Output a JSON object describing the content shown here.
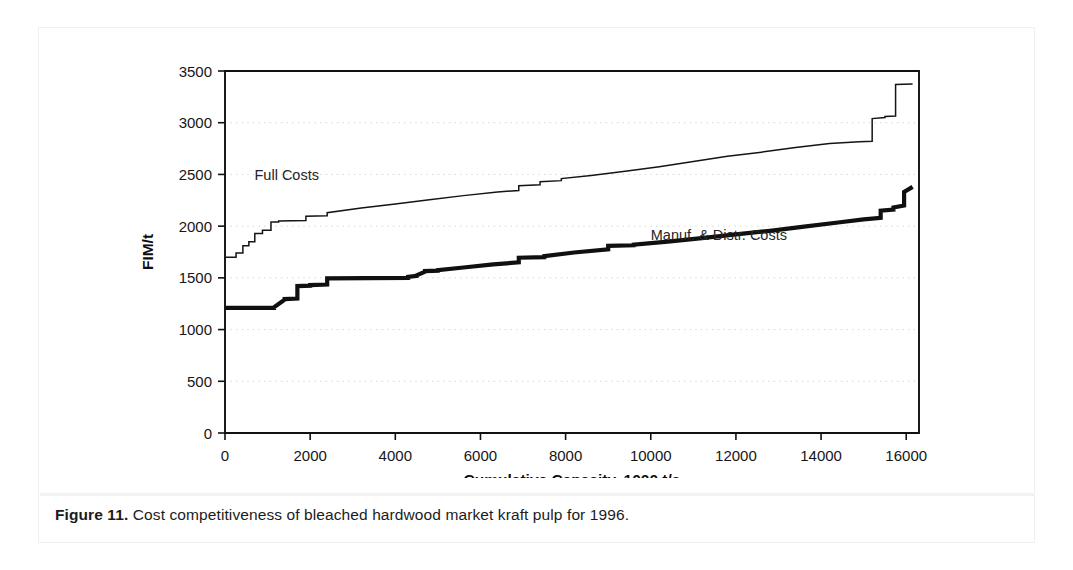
{
  "figure": {
    "caption_label": "Figure 11.",
    "caption_text": " Cost competitiveness of bleached hardwood market kraft pulp for 1996."
  },
  "chart_data": {
    "type": "line",
    "title": "",
    "xlabel": "Cumulative Capacity, 1000 t/a",
    "ylabel": "FIM/t",
    "xlim": [
      0,
      16300
    ],
    "ylim": [
      0,
      3500
    ],
    "xticks": [
      0,
      2000,
      4000,
      6000,
      8000,
      10000,
      12000,
      14000,
      16000
    ],
    "xtick_labels": [
      "0",
      "2000",
      "4000",
      "6000",
      "8000",
      "10000",
      "12000",
      "14000",
      "16000"
    ],
    "yticks": [
      0,
      500,
      1000,
      1500,
      2000,
      2500,
      3000,
      3500
    ],
    "ytick_labels": [
      "0",
      "500",
      "1000",
      "1500",
      "2000",
      "2500",
      "3000",
      "3500"
    ],
    "grid": "horizontal-dotted",
    "legend": "inline-annotations",
    "annotations": [
      {
        "name": "full-costs-label",
        "text": "Full Costs",
        "x": 1450,
        "y": 2450
      },
      {
        "name": "manuf-distr-label",
        "text": "Manuf. & Distr. Costs",
        "x": 11600,
        "y": 1870
      }
    ],
    "series": [
      {
        "name": "Full Costs",
        "style": "thin",
        "x": [
          0,
          260,
          260,
          420,
          420,
          560,
          560,
          700,
          700,
          880,
          880,
          1080,
          1080,
          1260,
          1260,
          1900,
          1900,
          2400,
          2400,
          3200,
          4000,
          4800,
          5600,
          6400,
          6900,
          6900,
          7400,
          7400,
          7900,
          7900,
          8600,
          9400,
          10200,
          11000,
          11800,
          12600,
          13400,
          14200,
          14900,
          15200,
          15200,
          15500,
          15500,
          15750,
          15750,
          16150
        ],
        "y": [
          1700,
          1700,
          1740,
          1740,
          1810,
          1810,
          1850,
          1850,
          1930,
          1930,
          1960,
          1960,
          2040,
          2040,
          2050,
          2055,
          2095,
          2100,
          2130,
          2175,
          2215,
          2255,
          2295,
          2330,
          2345,
          2390,
          2400,
          2430,
          2440,
          2460,
          2490,
          2530,
          2575,
          2625,
          2675,
          2715,
          2760,
          2800,
          2815,
          2820,
          3040,
          3050,
          3060,
          3065,
          3370,
          3375
        ]
      },
      {
        "name": "Manuf. & Distr. Costs",
        "style": "thick",
        "x": [
          0,
          1150,
          1150,
          1400,
          1400,
          1700,
          1700,
          2000,
          2000,
          2400,
          2400,
          4300,
          4300,
          4500,
          4500,
          4700,
          4700,
          5000,
          5000,
          5600,
          6300,
          6900,
          6900,
          7500,
          7500,
          8200,
          9000,
          9000,
          9600,
          9600,
          10400,
          11200,
          12000,
          12800,
          13600,
          14400,
          15000,
          15400,
          15400,
          15700,
          15700,
          15950,
          15950,
          16150
        ],
        "y": [
          1210,
          1210,
          1215,
          1290,
          1295,
          1300,
          1420,
          1425,
          1430,
          1435,
          1495,
          1500,
          1510,
          1520,
          1525,
          1560,
          1565,
          1570,
          1575,
          1600,
          1630,
          1650,
          1695,
          1700,
          1710,
          1745,
          1775,
          1810,
          1815,
          1820,
          1850,
          1885,
          1920,
          1955,
          1995,
          2035,
          2065,
          2080,
          2150,
          2160,
          2180,
          2200,
          2330,
          2380
        ]
      }
    ]
  }
}
